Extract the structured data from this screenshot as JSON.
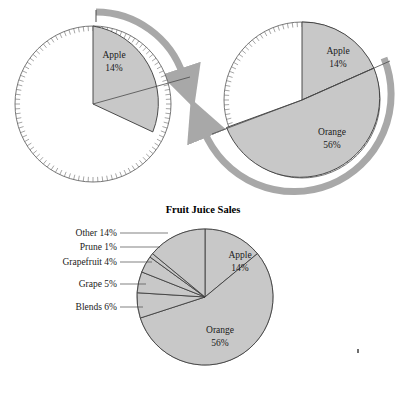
{
  "figure": {
    "title": "Fruit Juice Sales",
    "background_color": "#ffffff",
    "slice_fill_color": "#c8c8c8",
    "slice_stroke_color": "#3a3a3a",
    "arrow_color": "#a8a8a8",
    "tick_color": "#6a6a6a",
    "text_color": "#1a1a1a"
  },
  "chart_data": {
    "type": "pie",
    "title": "Fruit Juice Sales",
    "categories": [
      "Orange",
      "Apple",
      "Other",
      "Blends",
      "Grape",
      "Grapefruit",
      "Prune"
    ],
    "values": [
      56,
      14,
      14,
      6,
      5,
      4,
      1
    ],
    "labels": [
      "Orange 56%",
      "Apple 14%",
      "Other 14%",
      "Blends 6%",
      "Grape 5%",
      "Grapefruit 4%",
      "Prune 1%"
    ],
    "units": "percent",
    "total": 100,
    "legend": "none",
    "grid": false,
    "panels": [
      {
        "id": "panel-top-left",
        "description": "Circle with single Apple wedge and clockwise sweep arrow",
        "visible_slices": [
          {
            "name": "Apple",
            "value": 14,
            "label": "Apple",
            "percent_label": "14%"
          }
        ],
        "arrow_direction": "clockwise"
      },
      {
        "id": "panel-top-right",
        "description": "Circle with Apple and Orange wedges and counterclockwise sweep arrow",
        "visible_slices": [
          {
            "name": "Apple",
            "value": 14,
            "label": "Apple",
            "percent_label": "14%"
          },
          {
            "name": "Orange",
            "value": 56,
            "label": "Orange",
            "percent_label": "56%"
          }
        ],
        "arrow_direction": "counterclockwise"
      },
      {
        "id": "panel-bottom",
        "description": "Complete pie with all seven slices and leader-line callouts",
        "visible_slices": [
          {
            "name": "Apple",
            "value": 14,
            "label": "Apple",
            "percent_label": "14%"
          },
          {
            "name": "Orange",
            "value": 56,
            "label": "Orange",
            "percent_label": "56%"
          },
          {
            "name": "Blends",
            "value": 6,
            "label": "Blends 6%"
          },
          {
            "name": "Grape",
            "value": 5,
            "label": "Grape 5%"
          },
          {
            "name": "Grapefruit",
            "value": 4,
            "label": "Grapefruit 4%"
          },
          {
            "name": "Prune",
            "value": 1,
            "label": "Prune 1%"
          },
          {
            "name": "Other",
            "value": 14,
            "label": "Other 14%"
          }
        ],
        "callouts": [
          {
            "label": "Other 14%",
            "name": "Other",
            "value": 14
          },
          {
            "label": "Prune 1%",
            "name": "Prune",
            "value": 1
          },
          {
            "label": "Grapefruit 4%",
            "name": "Grapefruit",
            "value": 4
          },
          {
            "label": "Grape 5%",
            "name": "Grape",
            "value": 5
          },
          {
            "label": "Blends 6%",
            "name": "Blends",
            "value": 6
          }
        ]
      }
    ]
  },
  "panel_top_left": {
    "apple_label": "Apple",
    "apple_percent": "14%"
  },
  "panel_top_right": {
    "apple_label": "Apple",
    "apple_percent": "14%",
    "orange_label": "Orange",
    "orange_percent": "56%"
  },
  "panel_bottom": {
    "apple_label": "Apple",
    "apple_percent": "14%",
    "orange_label": "Orange",
    "orange_percent": "56%",
    "callout_other": "Other 14%",
    "callout_prune": "Prune 1%",
    "callout_grapefruit": "Grapefruit 4%",
    "callout_grape": "Grape 5%",
    "callout_blends": "Blends 6%"
  }
}
